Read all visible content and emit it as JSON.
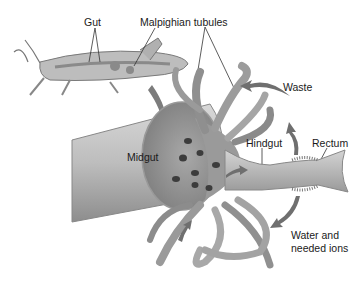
{
  "diagram": {
    "labels": {
      "gut": "Gut",
      "malpighian_tubules": "Malpighian tubules",
      "waste": "Waste",
      "midgut": "Midgut",
      "hindgut": "Hindgut",
      "rectum": "Rectum",
      "water_line1": "Water and",
      "water_line2": "needed ions"
    },
    "colors": {
      "organ_fill": "#b8b8b8",
      "organ_dark": "#8a8a8a",
      "tubule": "#9c9c9c",
      "arrow": "#6f6f6f",
      "background": "#ffffff"
    }
  }
}
